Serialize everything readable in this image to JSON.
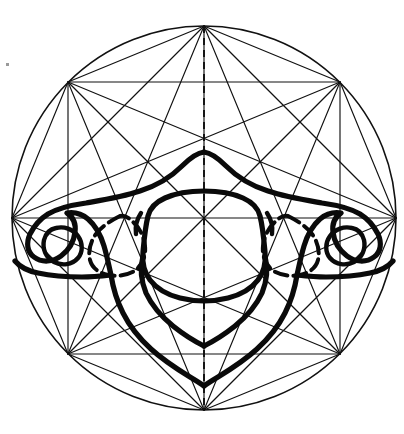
{
  "figure": {
    "kind": "anatomical-geometric-diagram",
    "caption": "",
    "background_color": "#ffffff",
    "ink_color": "#111111",
    "bone_color": "#0a0a0a"
  },
  "canvas": {
    "width": 404,
    "height": 434
  },
  "construction": {
    "circle": {
      "label": "circumscribing-circle",
      "cx": 204,
      "cy": 218,
      "r": 192,
      "stroke_width": 1.6
    },
    "polygon": {
      "label": "regular-octagon",
      "sides": 8,
      "rotation_deg": 22.5,
      "vertex_count": 8,
      "vertices": [
        {
          "name": "top",
          "x": 204,
          "y": 26
        },
        {
          "name": "upper-right",
          "x": 340,
          "y": 82
        },
        {
          "name": "right",
          "x": 396,
          "y": 218
        },
        {
          "name": "lower-right",
          "x": 340,
          "y": 354
        },
        {
          "name": "bottom",
          "x": 204,
          "y": 410
        },
        {
          "name": "lower-left",
          "x": 68,
          "y": 354
        },
        {
          "name": "left",
          "x": 12,
          "y": 218
        },
        {
          "name": "upper-left",
          "x": 68,
          "y": 82
        }
      ],
      "draw_all_diagonals": true,
      "diagonal_count": 20
    },
    "axis": {
      "label": "vertical-midline",
      "style": "dashed",
      "x": 204,
      "y_start": 26,
      "y_end": 410,
      "dash_pattern": "7 5"
    }
  },
  "anatomy": {
    "specimen": "cervical vertebra",
    "view": "superior / axial",
    "parts": [
      {
        "name": "vertebral-body-outline",
        "style": "solid-bold"
      },
      {
        "name": "vertebral-foramen",
        "style": "solid-bold"
      },
      {
        "name": "left-transverse-process",
        "style": "solid-bold"
      },
      {
        "name": "right-transverse-process",
        "style": "solid-bold"
      },
      {
        "name": "left-transverse-foramen",
        "style": "solid-bold"
      },
      {
        "name": "right-transverse-foramen",
        "style": "solid-bold"
      },
      {
        "name": "left-articular-facet",
        "style": "dashed-bold"
      },
      {
        "name": "right-articular-facet",
        "style": "dashed-bold"
      },
      {
        "name": "spinous-process",
        "style": "solid-bold"
      },
      {
        "name": "lamina-outline",
        "style": "solid-bold"
      }
    ]
  },
  "artifacts": [
    {
      "name": "scan-speck",
      "x": 6,
      "y": 63
    }
  ]
}
